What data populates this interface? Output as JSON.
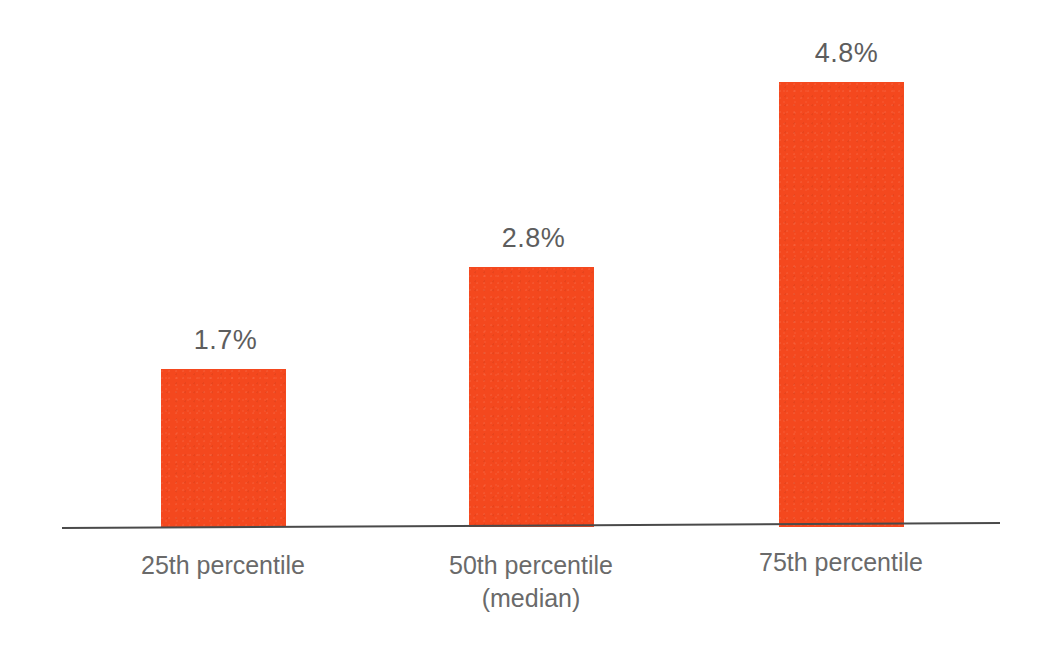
{
  "chart_data": {
    "type": "bar",
    "title": "",
    "subtitle": "",
    "xlabel": "",
    "ylabel": "",
    "categories": [
      "25th percentile",
      "50th percentile\n(median)",
      "75th percentile"
    ],
    "values": [
      1.7,
      2.8,
      4.8
    ],
    "value_labels": [
      "1.7%",
      "2.8%",
      "4.8%"
    ],
    "units": "%",
    "ylim": [
      0,
      5.2
    ],
    "grid": false,
    "legend": null,
    "legend_position": "none",
    "series": [
      {
        "name": "",
        "values": [
          1.7,
          2.8,
          4.8
        ],
        "color": "#f4481e"
      }
    ],
    "annotations": []
  },
  "colors": {
    "bar": "#f4481e",
    "axis": "#4a4a4a",
    "value_label_text": "#5d5d5d",
    "category_label_text": "#6a6a6a",
    "background": "#ffffff"
  },
  "axis": {
    "has_baseline": true,
    "has_y_axis": false,
    "has_ticks": false
  }
}
